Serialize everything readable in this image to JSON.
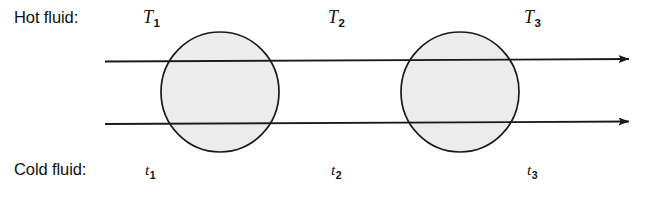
{
  "diagram": {
    "background_color": "#ffffff",
    "line_color": "#1a1a1a",
    "exchanger_fill_color": "#ececec",
    "exchanger_stroke_color": "#1a1a1a",
    "text_color": "#111111"
  },
  "labels": {
    "hot_fluid": "Hot fluid:",
    "cold_fluid": "Cold fluid:"
  },
  "hot_stream": {
    "temperatures": [
      {
        "symbol": "T",
        "subscript": "1"
      },
      {
        "symbol": "T",
        "subscript": "2"
      },
      {
        "symbol": "T",
        "subscript": "3"
      }
    ]
  },
  "cold_stream": {
    "temperatures": [
      {
        "symbol": "t",
        "subscript": "1"
      },
      {
        "symbol": "t",
        "subscript": "2"
      },
      {
        "symbol": "t",
        "subscript": "3"
      }
    ]
  },
  "flow_lines": [
    {
      "name": "hot-fluid-flow-line",
      "y": 61,
      "x_start": 105,
      "x_end": 641,
      "direction": "right"
    },
    {
      "name": "cold-fluid-flow-line",
      "y": 123,
      "x_start": 105,
      "x_end": 641,
      "direction": "right"
    }
  ],
  "exchangers": [
    {
      "name": "heat-exchanger-1",
      "cx": 220,
      "cy": 92,
      "rx": 59,
      "ry": 60
    },
    {
      "name": "heat-exchanger-2",
      "cx": 460,
      "cy": 92,
      "rx": 59,
      "ry": 60
    }
  ]
}
